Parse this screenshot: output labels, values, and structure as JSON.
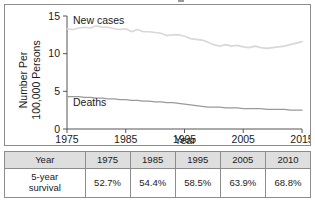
{
  "chart_data": {
    "type": "line",
    "title": "",
    "xlabel": "Year",
    "ylabel": "Number Per 100,000 Persons",
    "ylabel_line1": "Number Per",
    "ylabel_line2": "100,000 Persons",
    "xlim": [
      1975,
      2015
    ],
    "ylim": [
      0,
      15
    ],
    "xticks": [
      "1975",
      "1985",
      "1995",
      "2005",
      "2015"
    ],
    "xtick_values": [
      1975,
      1985,
      1995,
      2005,
      2015
    ],
    "yticks": [
      "0",
      "5",
      "10",
      "15"
    ],
    "ytick_values": [
      0,
      5,
      10,
      15
    ],
    "grid": false,
    "legend_position": "inline-annotations",
    "series": [
      {
        "name": "New cases",
        "color": "#d8d8d8",
        "annotation_label": "New cases",
        "x": [
          1975,
          1976,
          1977,
          1978,
          1979,
          1980,
          1981,
          1982,
          1983,
          1984,
          1985,
          1986,
          1987,
          1988,
          1989,
          1990,
          1991,
          1992,
          1993,
          1994,
          1995,
          1996,
          1997,
          1998,
          1999,
          2000,
          2001,
          2002,
          2003,
          2004,
          2005,
          2006,
          2007,
          2008,
          2009,
          2010,
          2011,
          2012,
          2013,
          2014,
          2015
        ],
        "values": [
          13.3,
          13.2,
          13.4,
          13.5,
          13.4,
          13.7,
          13.5,
          13.5,
          13.3,
          13.2,
          13.3,
          12.9,
          13.2,
          12.9,
          12.9,
          12.8,
          12.7,
          12.4,
          12.5,
          12.5,
          12.3,
          12.0,
          11.9,
          11.8,
          11.5,
          11.2,
          11.0,
          11.2,
          11.0,
          11.1,
          10.9,
          10.8,
          11.0,
          10.8,
          10.7,
          10.8,
          10.9,
          11.0,
          11.2,
          11.4,
          11.6
        ]
      },
      {
        "name": "Deaths",
        "color": "#9a9a9a",
        "annotation_label": "Deaths",
        "x": [
          1975,
          1976,
          1977,
          1978,
          1979,
          1980,
          1981,
          1982,
          1983,
          1984,
          1985,
          1986,
          1987,
          1988,
          1989,
          1990,
          1991,
          1992,
          1993,
          1994,
          1995,
          1996,
          1997,
          1998,
          1999,
          2000,
          2001,
          2002,
          2003,
          2004,
          2005,
          2006,
          2007,
          2008,
          2009,
          2010,
          2011,
          2012,
          2013,
          2014,
          2015
        ],
        "values": [
          4.3,
          4.3,
          4.3,
          4.2,
          4.2,
          4.1,
          4.1,
          4.0,
          4.0,
          3.9,
          3.9,
          3.8,
          3.8,
          3.7,
          3.7,
          3.6,
          3.6,
          3.5,
          3.5,
          3.4,
          3.3,
          3.2,
          3.1,
          3.0,
          2.9,
          2.9,
          2.9,
          2.8,
          2.8,
          2.8,
          2.7,
          2.7,
          2.7,
          2.7,
          2.6,
          2.6,
          2.6,
          2.6,
          2.5,
          2.5,
          2.5
        ]
      }
    ]
  },
  "chart": {
    "annotations": {
      "new_cases": "New cases",
      "deaths": "Deaths"
    },
    "axis": {
      "x_label": "Year",
      "y_label_line1": "Number Per",
      "y_label_line2": "100,000 Persons",
      "x_tick_1": "1975",
      "x_tick_2": "1985",
      "x_tick_3": "1995",
      "x_tick_4": "2005",
      "x_tick_5": "2015",
      "y_tick_1": "0",
      "y_tick_2": "5",
      "y_tick_3": "10",
      "y_tick_4": "15"
    }
  },
  "table": {
    "header": [
      "Year",
      "1975",
      "1985",
      "1995",
      "2005",
      "2010"
    ],
    "row_label_line1": "5-year",
    "row_label_line2": "survival",
    "rows": [
      {
        "label": "5-year survival",
        "values": [
          "52.7%",
          "54.4%",
          "58.5%",
          "63.9%",
          "68.8%"
        ]
      }
    ]
  },
  "colors": {
    "new_cases_line": "#d8d8d8",
    "deaths_line": "#9a9a9a",
    "axis": "#555555",
    "border": "#8c8c8c",
    "header_bg": "#dedede"
  }
}
